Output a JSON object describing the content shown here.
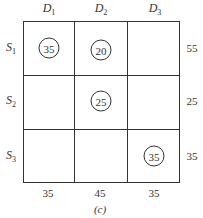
{
  "columns": [
    {
      "name": "D",
      "sub": "1",
      "demand": "35"
    },
    {
      "name": "D",
      "sub": "2",
      "demand": "45"
    },
    {
      "name": "D",
      "sub": "3",
      "demand": "35"
    }
  ],
  "rows": [
    {
      "name": "S",
      "sub": "1",
      "supply": "55"
    },
    {
      "name": "S",
      "sub": "2",
      "supply": "25"
    },
    {
      "name": "S",
      "sub": "3",
      "supply": "35"
    }
  ],
  "allocations": [
    {
      "row": 1,
      "col": 1,
      "value": "35"
    },
    {
      "row": 1,
      "col": 2,
      "value": "20"
    },
    {
      "row": 2,
      "col": 2,
      "value": "25"
    },
    {
      "row": 3,
      "col": 3,
      "value": "35"
    }
  ],
  "caption": "(c)"
}
